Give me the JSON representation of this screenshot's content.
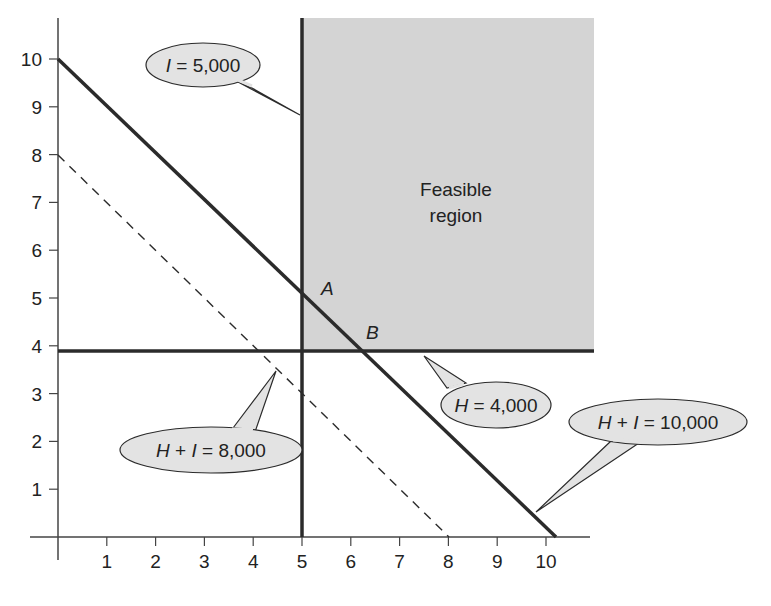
{
  "chart_data": {
    "type": "line",
    "title": "",
    "xlabel": "",
    "ylabel": "",
    "xlim": [
      0,
      10.5
    ],
    "ylim": [
      0,
      10.5
    ],
    "grid": false,
    "x_ticks": [
      "1",
      "2",
      "3",
      "4",
      "5",
      "6",
      "7",
      "8",
      "9",
      "10"
    ],
    "y_ticks": [
      "1",
      "2",
      "3",
      "4",
      "5",
      "6",
      "7",
      "8",
      "9",
      "10"
    ],
    "series": [
      {
        "name": "H + I = 10,000",
        "style": "solid-thick",
        "points": [
          [
            0,
            10
          ],
          [
            10,
            0
          ]
        ]
      },
      {
        "name": "H + I = 8,000",
        "style": "dashed",
        "points": [
          [
            0,
            8
          ],
          [
            8,
            0
          ]
        ]
      },
      {
        "name": "I = 5,000",
        "style": "solid-thick",
        "points": [
          [
            5,
            0
          ],
          [
            5,
            10.8
          ]
        ]
      },
      {
        "name": "H = 4,000",
        "style": "solid-thick",
        "points": [
          [
            0,
            4
          ],
          [
            11.1,
            4
          ]
        ]
      }
    ],
    "feasible_region": {
      "label_line1": "Feasible",
      "label_line2": "region",
      "x_range": [
        5,
        11.1
      ],
      "y_range": [
        4,
        10.8
      ],
      "fill": "#d4d4d4"
    },
    "points": [
      {
        "label": "A",
        "x": 5,
        "y": 5
      },
      {
        "label": "B",
        "x": 6,
        "y": 4
      }
    ],
    "annotations": [
      {
        "id": "i5000",
        "text_var": "I",
        "text_rest": " = 5,000"
      },
      {
        "id": "h4000",
        "text_var": "H",
        "text_rest": " = 4,000"
      },
      {
        "id": "hi8000",
        "text_var1": "H",
        "text_mid": " + ",
        "text_var2": "I",
        "text_rest": " = 8,000"
      },
      {
        "id": "hi10000",
        "text_var1": "H",
        "text_mid": " + ",
        "text_var2": "I",
        "text_rest": " = 10,000"
      }
    ]
  },
  "colors": {
    "line": "#2b2b2b",
    "axis": "#444444",
    "region_fill": "#d4d4d4",
    "callout_fill": "#e3e3e3",
    "callout_stroke": "#2b2b2b"
  }
}
